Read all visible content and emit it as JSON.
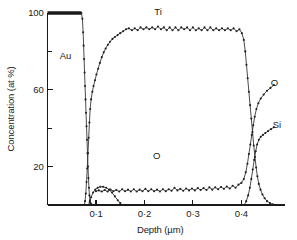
{
  "chart_data": {
    "type": "line",
    "title": "",
    "xlabel": "Depth (µm)",
    "ylabel": "Concentration (at %)",
    "xlim": [
      0.0,
      0.49
    ],
    "ylim": [
      0,
      100
    ],
    "xticks": [
      0.1,
      0.2,
      0.3,
      0.4
    ],
    "xtick_labels": [
      "0·1",
      "0·2",
      "0·3",
      "0·4"
    ],
    "yticks": [
      20,
      60,
      100
    ],
    "ytick_labels": [
      "20",
      "60",
      "100"
    ],
    "yticks_minor": [
      40,
      80
    ],
    "grid": false,
    "legend_position": "inline-annotations",
    "annotations": [
      {
        "text": "Au",
        "x": 0.037,
        "y": 76
      },
      {
        "text": "Ti",
        "x": 0.228,
        "y": 99
      },
      {
        "text": "O",
        "x": 0.225,
        "y": 24
      },
      {
        "text": "O",
        "x": 0.468,
        "y": 62
      },
      {
        "text": "Si",
        "x": 0.473,
        "y": 40
      }
    ],
    "series": [
      {
        "name": "Au",
        "markers": true,
        "points": [
          [
            0.0,
            100.0
          ],
          [
            0.006,
            100.0
          ],
          [
            0.012,
            100.0
          ],
          [
            0.018,
            100.0
          ],
          [
            0.024,
            100.0
          ],
          [
            0.03,
            100.0
          ],
          [
            0.036,
            100.0
          ],
          [
            0.042,
            100.0
          ],
          [
            0.048,
            100.0
          ],
          [
            0.054,
            100.0
          ],
          [
            0.06,
            100.0
          ],
          [
            0.066,
            100.0
          ],
          [
            0.07,
            100.0
          ],
          [
            0.072,
            97.0
          ],
          [
            0.0735,
            90.0
          ],
          [
            0.0745,
            83.0
          ],
          [
            0.0755,
            76.0
          ],
          [
            0.0765,
            69.0
          ],
          [
            0.0775,
            62.0
          ],
          [
            0.0785,
            55.0
          ],
          [
            0.0795,
            48.0
          ],
          [
            0.0805,
            41.0
          ],
          [
            0.0815,
            34.0
          ],
          [
            0.0825,
            27.0
          ],
          [
            0.0835,
            20.0
          ],
          [
            0.0845,
            14.0
          ],
          [
            0.0855,
            9.0
          ],
          [
            0.0865,
            5.0
          ],
          [
            0.0875,
            2.5
          ],
          [
            0.0885,
            1.2
          ],
          [
            0.0895,
            0.5
          ],
          [
            0.091,
            0.2
          ],
          [
            0.094,
            0.0
          ]
        ]
      },
      {
        "name": "Ti",
        "markers": true,
        "points": [
          [
            0.076,
            0.0
          ],
          [
            0.0775,
            2.0
          ],
          [
            0.079,
            6.0
          ],
          [
            0.0805,
            12.0
          ],
          [
            0.082,
            19.0
          ],
          [
            0.0835,
            27.0
          ],
          [
            0.085,
            35.0
          ],
          [
            0.0865,
            43.0
          ],
          [
            0.088,
            50.0
          ],
          [
            0.09,
            55.0
          ],
          [
            0.0925,
            59.0
          ],
          [
            0.095,
            62.0
          ],
          [
            0.098,
            65.0
          ],
          [
            0.101,
            68.0
          ],
          [
            0.1045,
            71.0
          ],
          [
            0.108,
            74.0
          ],
          [
            0.112,
            77.0
          ],
          [
            0.116,
            79.5
          ],
          [
            0.12,
            81.5
          ],
          [
            0.1245,
            83.5
          ],
          [
            0.129,
            85.0
          ],
          [
            0.134,
            86.5
          ],
          [
            0.139,
            87.5
          ],
          [
            0.1445,
            88.5
          ],
          [
            0.15,
            89.5
          ],
          [
            0.156,
            90.5
          ],
          [
            0.162,
            91.5
          ],
          [
            0.168,
            92.0
          ],
          [
            0.174,
            91.0
          ],
          [
            0.18,
            92.0
          ],
          [
            0.186,
            91.0
          ],
          [
            0.192,
            92.5
          ],
          [
            0.198,
            91.5
          ],
          [
            0.204,
            92.5
          ],
          [
            0.21,
            91.5
          ],
          [
            0.216,
            92.5
          ],
          [
            0.222,
            91.5
          ],
          [
            0.228,
            93.0
          ],
          [
            0.234,
            91.5
          ],
          [
            0.24,
            92.5
          ],
          [
            0.246,
            91.0
          ],
          [
            0.252,
            92.5
          ],
          [
            0.258,
            91.0
          ],
          [
            0.264,
            92.5
          ],
          [
            0.27,
            91.0
          ],
          [
            0.276,
            92.5
          ],
          [
            0.282,
            91.5
          ],
          [
            0.288,
            92.5
          ],
          [
            0.294,
            91.0
          ],
          [
            0.3,
            92.5
          ],
          [
            0.306,
            91.0
          ],
          [
            0.312,
            92.0
          ],
          [
            0.318,
            91.0
          ],
          [
            0.324,
            92.5
          ],
          [
            0.33,
            91.0
          ],
          [
            0.336,
            92.5
          ],
          [
            0.342,
            91.0
          ],
          [
            0.348,
            92.0
          ],
          [
            0.354,
            91.0
          ],
          [
            0.36,
            92.0
          ],
          [
            0.366,
            91.0
          ],
          [
            0.372,
            92.0
          ],
          [
            0.378,
            91.0
          ],
          [
            0.384,
            92.0
          ],
          [
            0.39,
            90.5
          ],
          [
            0.396,
            91.5
          ],
          [
            0.401,
            89.5
          ],
          [
            0.405,
            86.0
          ],
          [
            0.408,
            80.0
          ],
          [
            0.4105,
            73.0
          ],
          [
            0.413,
            66.0
          ],
          [
            0.4155,
            59.0
          ],
          [
            0.418,
            52.0
          ],
          [
            0.4205,
            45.0
          ],
          [
            0.423,
            38.0
          ],
          [
            0.4255,
            31.0
          ],
          [
            0.428,
            25.0
          ],
          [
            0.4305,
            19.5
          ],
          [
            0.433,
            15.0
          ],
          [
            0.436,
            11.0
          ],
          [
            0.4395,
            8.0
          ],
          [
            0.4435,
            5.5
          ],
          [
            0.448,
            3.5
          ],
          [
            0.453,
            2.0
          ],
          [
            0.459,
            1.0
          ],
          [
            0.465,
            0.3
          ]
        ]
      },
      {
        "name": "O",
        "markers": true,
        "points": [
          [
            0.084,
            0.0
          ],
          [
            0.087,
            1.5
          ],
          [
            0.09,
            4.0
          ],
          [
            0.094,
            6.5
          ],
          [
            0.0985,
            8.0
          ],
          [
            0.1035,
            9.0
          ],
          [
            0.109,
            9.5
          ],
          [
            0.115,
            9.5
          ],
          [
            0.121,
            9.0
          ],
          [
            0.127,
            8.0
          ],
          [
            0.133,
            6.5
          ],
          [
            0.139,
            4.5
          ],
          [
            0.145,
            2.5
          ],
          [
            0.15,
            1.0
          ],
          [
            0.1545,
            0.0
          ],
          [
            0.1,
            7.2
          ],
          [
            0.106,
            7.6
          ],
          [
            0.112,
            7.0
          ],
          [
            0.118,
            7.8
          ],
          [
            0.124,
            7.0
          ],
          [
            0.13,
            8.0
          ],
          [
            0.136,
            7.2
          ],
          [
            0.142,
            7.8
          ],
          [
            0.148,
            7.0
          ],
          [
            0.154,
            8.2
          ],
          [
            0.16,
            7.2
          ],
          [
            0.166,
            8.0
          ],
          [
            0.172,
            7.0
          ],
          [
            0.178,
            8.2
          ],
          [
            0.184,
            7.0
          ],
          [
            0.19,
            8.0
          ],
          [
            0.196,
            7.2
          ],
          [
            0.202,
            8.4
          ],
          [
            0.208,
            7.2
          ],
          [
            0.214,
            8.2
          ],
          [
            0.22,
            7.2
          ],
          [
            0.226,
            8.0
          ],
          [
            0.232,
            7.0
          ],
          [
            0.238,
            8.2
          ],
          [
            0.244,
            7.2
          ],
          [
            0.25,
            8.2
          ],
          [
            0.256,
            7.4
          ],
          [
            0.262,
            9.0
          ],
          [
            0.268,
            7.6
          ],
          [
            0.274,
            8.4
          ],
          [
            0.28,
            7.4
          ],
          [
            0.286,
            8.6
          ],
          [
            0.292,
            7.6
          ],
          [
            0.298,
            8.6
          ],
          [
            0.304,
            7.6
          ],
          [
            0.31,
            8.8
          ],
          [
            0.316,
            7.8
          ],
          [
            0.322,
            8.8
          ],
          [
            0.328,
            7.8
          ],
          [
            0.334,
            9.2
          ],
          [
            0.34,
            8.0
          ],
          [
            0.346,
            9.2
          ],
          [
            0.352,
            8.2
          ],
          [
            0.358,
            9.4
          ],
          [
            0.364,
            8.4
          ],
          [
            0.37,
            9.6
          ],
          [
            0.376,
            8.6
          ],
          [
            0.382,
            10.0
          ],
          [
            0.388,
            9.0
          ],
          [
            0.394,
            10.6
          ],
          [
            0.4,
            11.5
          ],
          [
            0.405,
            13.5
          ],
          [
            0.409,
            17.0
          ],
          [
            0.4125,
            21.5
          ],
          [
            0.4155,
            26.5
          ],
          [
            0.4185,
            31.5
          ],
          [
            0.4215,
            36.5
          ],
          [
            0.4245,
            41.5
          ],
          [
            0.4275,
            46.0
          ],
          [
            0.431,
            50.0
          ],
          [
            0.435,
            53.0
          ],
          [
            0.44,
            55.5
          ],
          [
            0.446,
            57.5
          ],
          [
            0.453,
            59.5
          ],
          [
            0.46,
            61.0
          ],
          [
            0.467,
            62.5
          ]
        ],
        "split_index": 15
      },
      {
        "name": "Si",
        "markers": true,
        "points": [
          [
            0.406,
            0.0
          ],
          [
            0.41,
            2.0
          ],
          [
            0.414,
            5.0
          ],
          [
            0.4175,
            9.0
          ],
          [
            0.4205,
            13.5
          ],
          [
            0.4235,
            18.5
          ],
          [
            0.4265,
            23.5
          ],
          [
            0.4295,
            28.0
          ],
          [
            0.4325,
            31.5
          ],
          [
            0.436,
            34.0
          ],
          [
            0.44,
            35.5
          ],
          [
            0.4445,
            36.5
          ],
          [
            0.4495,
            37.5
          ],
          [
            0.455,
            38.5
          ],
          [
            0.461,
            39.5
          ],
          [
            0.467,
            40.5
          ]
        ]
      }
    ]
  },
  "axes": {
    "x_title": "Depth (µm)",
    "y_title": "Concentration (at %)"
  }
}
